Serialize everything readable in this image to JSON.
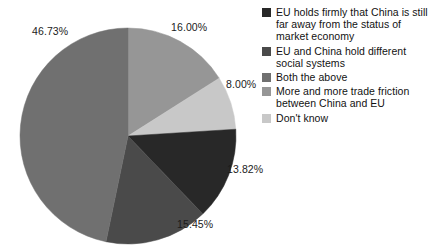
{
  "chart_data": {
    "type": "pie",
    "title": "",
    "legend_position": "right",
    "start_angle_deg": 0,
    "direction": "clockwise",
    "categories": [
      "EU holds firmly that China is still far away from the status of market economy",
      "EU and China hold different social systems",
      "Both the above",
      "More and more trade friction between China and EU",
      "Don't know"
    ],
    "values": [
      13.82,
      15.45,
      46.73,
      16.0,
      8.0
    ],
    "value_labels": [
      "13.82%",
      "15.45%",
      "46.73%",
      "16.00%",
      "8.00%"
    ],
    "colors": [
      "#282828",
      "#4a4a4a",
      "#707070",
      "#969696",
      "#c8c8c8"
    ],
    "slices_clockwise_from_top": [
      {
        "label": "16.00%",
        "value": 16.0,
        "color": "#969696"
      },
      {
        "label": "8.00%",
        "value": 8.0,
        "color": "#c8c8c8"
      },
      {
        "label": "13.82%",
        "value": 13.82,
        "color": "#282828"
      },
      {
        "label": "15.45%",
        "value": 15.45,
        "color": "#4a4a4a"
      },
      {
        "label": "46.73%",
        "value": 46.73,
        "color": "#707070"
      }
    ]
  },
  "pie": {
    "labels": [
      {
        "text": "46.73%",
        "x": 32,
        "y": 25
      },
      {
        "text": "16.00%",
        "x": 171,
        "y": 21
      },
      {
        "text": "8.00%",
        "x": 226,
        "y": 78
      },
      {
        "text": "13.82%",
        "x": 227,
        "y": 163
      },
      {
        "text": "15.45%",
        "x": 177,
        "y": 218
      }
    ]
  },
  "legend": {
    "items": [
      {
        "color": "#282828",
        "lines": [
          "EU holds firmly that China is still",
          "far away from the status of",
          "market economy"
        ]
      },
      {
        "color": "#4a4a4a",
        "lines": [
          "EU and China hold different",
          "social systems"
        ]
      },
      {
        "color": "#707070",
        "lines": [
          "Both the above"
        ]
      },
      {
        "color": "#969696",
        "lines": [
          "More and more trade friction",
          "between China and EU"
        ]
      },
      {
        "color": "#c8c8c8",
        "lines": [
          "Don't know"
        ]
      }
    ]
  }
}
